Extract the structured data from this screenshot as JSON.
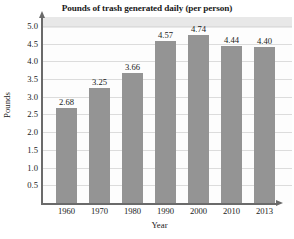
{
  "chart_data": {
    "type": "bar",
    "title": "Pounds of trash generated daily (per person)",
    "xlabel": "Year",
    "ylabel": "Pounds",
    "categories": [
      "1960",
      "1970",
      "1980",
      "1990",
      "2000",
      "2010",
      "2013"
    ],
    "values": [
      2.68,
      3.25,
      3.66,
      4.57,
      4.74,
      4.44,
      4.4
    ],
    "value_labels": [
      "2.68",
      "3.25",
      "3.66",
      "4.57",
      "4.74",
      "4.44",
      "4.40"
    ],
    "ylim": [
      0,
      5.25
    ],
    "ytick_labels": [
      "5.0",
      "4.5",
      "4.0",
      "3.5",
      "3.0",
      "2.5",
      "2.0",
      "1.5",
      "1.0",
      "0.5"
    ],
    "ytick_values": [
      5.0,
      4.5,
      4.0,
      3.5,
      3.0,
      2.5,
      2.0,
      1.5,
      1.0,
      0.5
    ],
    "grid": true,
    "legend": null,
    "bar_color": "#949494",
    "axis_color": "#6a6a6a",
    "gridline_color": "#dcdcdc",
    "plot_background": "#fdfdfd"
  }
}
